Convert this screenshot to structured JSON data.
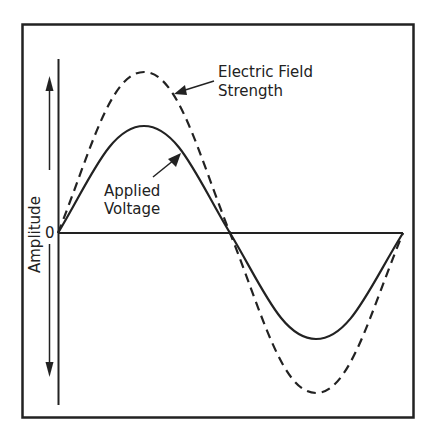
{
  "diagram": {
    "type": "waveform-comparison",
    "axis_label": "Amplitude",
    "zero_label": "0",
    "series": [
      {
        "name": "Applied Voltage",
        "style": "solid",
        "relative_amplitude": 1.0
      },
      {
        "name": "Electric Field Strength",
        "style": "dashed",
        "relative_amplitude": 1.5
      }
    ],
    "labels": {
      "electric_field_line1": "Electric Field",
      "electric_field_line2": "Strength",
      "applied_voltage_line1": "Applied",
      "applied_voltage_line2": "Voltage"
    },
    "colors": {
      "stroke": "#222222",
      "background": "#ffffff"
    }
  }
}
